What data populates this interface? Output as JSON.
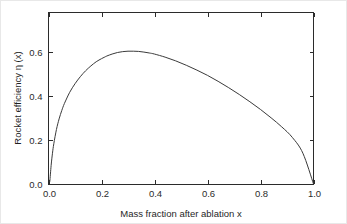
{
  "chart_data": {
    "type": "line",
    "title": "",
    "xlabel": "Mass fraction after ablation x",
    "ylabel": "Rocket efficiency η (x)",
    "xlim": [
      0.0,
      1.0
    ],
    "ylim": [
      0.0,
      0.78
    ],
    "grid": false,
    "legend": null,
    "xticks": [
      "0.0",
      "0.2",
      "0.4",
      "0.6",
      "0.8",
      "1.0"
    ],
    "xtick_values": [
      0.0,
      0.2,
      0.4,
      0.6,
      0.8,
      1.0
    ],
    "yticks": [
      "0.0",
      "0.2",
      "0.4",
      "0.6"
    ],
    "ytick_values": [
      0.0,
      0.2,
      0.4,
      0.6
    ],
    "series": [
      {
        "name": "Rocket efficiency",
        "color": "#3a3a3a",
        "x": [
          0.005,
          0.01,
          0.015,
          0.02,
          0.03,
          0.04,
          0.05,
          0.06,
          0.08,
          0.1,
          0.12,
          0.14,
          0.16,
          0.18,
          0.2,
          0.21,
          0.22,
          0.24,
          0.26,
          0.28,
          0.3,
          0.32,
          0.34,
          0.36,
          0.38,
          0.4,
          0.44,
          0.48,
          0.52,
          0.56,
          0.6,
          0.64,
          0.68,
          0.72,
          0.76,
          0.8,
          0.84,
          0.88,
          0.92,
          0.96,
          1.0
        ],
        "y": [
          0.012,
          0.085,
          0.14,
          0.183,
          0.248,
          0.296,
          0.334,
          0.366,
          0.417,
          0.456,
          0.488,
          0.515,
          0.537,
          0.556,
          0.57,
          0.576,
          0.582,
          0.591,
          0.598,
          0.602,
          0.604,
          0.604,
          0.603,
          0.6,
          0.596,
          0.591,
          0.577,
          0.56,
          0.54,
          0.518,
          0.494,
          0.467,
          0.438,
          0.407,
          0.374,
          0.339,
          0.301,
          0.26,
          0.212,
          0.14,
          0.0
        ],
        "peak": {
          "x": 0.21,
          "y": 0.645
        }
      }
    ]
  },
  "axes": {
    "x_axis_title": "Mass fraction after ablation x",
    "y_axis_title": "Rocket efficiency η (x)"
  }
}
